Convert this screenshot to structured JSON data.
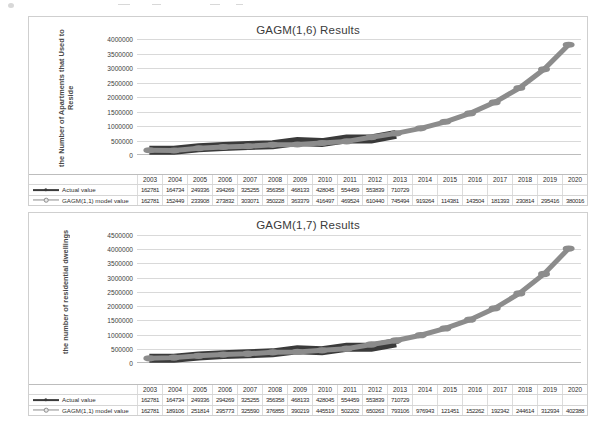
{
  "charts": [
    {
      "id": "gagm16",
      "title": "GAGM(1,6) Results",
      "ylabel": "the Number of Apartments that Used to Reside",
      "chart_data": {
        "type": "line",
        "title": "GAGM(1,6) Results",
        "xlabel": "",
        "ylabel": "the Number of Apartments that Used to Reside",
        "ylim": [
          0,
          4000000
        ],
        "ytick_step": 500000,
        "yticks": [
          "0",
          "500000",
          "1000000",
          "1500000",
          "2000000",
          "2500000",
          "3000000",
          "3500000",
          "4000000"
        ],
        "grid": true,
        "legend_position": "bottom-table",
        "categories": [
          "2003",
          "2004",
          "2005",
          "2006",
          "2007",
          "2008",
          "2009",
          "2010",
          "2011",
          "2012",
          "2013",
          "2014",
          "2015",
          "2016",
          "2017",
          "2018",
          "2019",
          "2020"
        ],
        "series": [
          {
            "name": "Actual value",
            "color": "#3a3a3a",
            "values": [
              162781,
              164734,
              249336,
              294269,
              325255,
              356358,
              468133,
              428045,
              554459,
              553839,
              710729,
              null,
              null,
              null,
              null,
              null,
              null,
              null
            ],
            "labels": [
              "162781",
              "164734",
              "249336",
              "294269",
              "325255",
              "356358",
              "468133",
              "428045",
              "554459",
              "553839",
              "710729",
              "",
              "",
              "",
              "",
              "",
              "",
              ""
            ]
          },
          {
            "name": "GAGM(1,1) model value",
            "color": "#8c8c8c",
            "values": [
              162781,
              152449,
              233908,
              273832,
              303071,
              350228,
              363379,
              416497,
              469524,
              610440,
              745494,
              919264,
              1143810,
              1435040,
              1813930,
              2308140,
              2954160,
              3800160
            ],
            "labels": [
              "162781",
              "152449",
              "233908",
              "273832",
              "303071",
              "350228",
              "363379",
              "416497",
              "469524",
              "610440",
              "745494",
              "919264",
              "114381",
              "143504",
              "181393",
              "230814",
              "295416",
              "380016"
            ]
          }
        ]
      }
    },
    {
      "id": "gagm17",
      "title": "GAGM(1,7) Results",
      "ylabel": "the number of residential dwellings",
      "chart_data": {
        "type": "line",
        "title": "GAGM(1,7) Results",
        "xlabel": "",
        "ylabel": "the number of residential dwellings",
        "ylim": [
          0,
          4500000
        ],
        "ytick_step": 500000,
        "yticks": [
          "0",
          "500000",
          "1000000",
          "1500000",
          "2000000",
          "2500000",
          "3000000",
          "3500000",
          "4000000",
          "4500000"
        ],
        "grid": true,
        "legend_position": "bottom-table",
        "categories": [
          "2003",
          "2004",
          "2005",
          "2006",
          "2007",
          "2008",
          "2009",
          "2010",
          "2011",
          "2012",
          "2013",
          "2014",
          "2015",
          "2016",
          "2017",
          "2018",
          "2019",
          "2020"
        ],
        "series": [
          {
            "name": "Actual value",
            "color": "#3a3a3a",
            "values": [
              162781,
              164734,
              249336,
              294269,
              325255,
              356358,
              468133,
              428045,
              554459,
              553839,
              710729,
              null,
              null,
              null,
              null,
              null,
              null,
              null
            ],
            "labels": [
              "162781",
              "164734",
              "249336",
              "294269",
              "325255",
              "356358",
              "468133",
              "428045",
              "554459",
              "553839",
              "710729",
              "",
              "",
              "",
              "",
              "",
              "",
              ""
            ]
          },
          {
            "name": "GAGM(1,1) model value",
            "color": "#8c8c8c",
            "values": [
              162781,
              189106,
              251814,
              295773,
              325590,
              376855,
              390219,
              445519,
              502202,
              650263,
              793106,
              976943,
              1214510,
              1522620,
              1923420,
              2446140,
              3129340,
              4023880
            ],
            "labels": [
              "162781",
              "189106",
              "251814",
              "295773",
              "325590",
              "376855",
              "390219",
              "445519",
              "502202",
              "650263",
              "793106",
              "976943",
              "121451",
              "152262",
              "192342",
              "244614",
              "312934",
              "402388"
            ]
          }
        ]
      }
    }
  ]
}
